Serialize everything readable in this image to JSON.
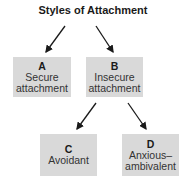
{
  "diagram": {
    "title": "Styles of Attachment",
    "nodes": [
      {
        "letter": "A",
        "line1": "Secure",
        "line2": "attachment"
      },
      {
        "letter": "B",
        "line1": "Insecure",
        "line2": "attachment"
      },
      {
        "letter": "C",
        "line1": "Avoidant",
        "line2": ""
      },
      {
        "letter": "D",
        "line1": "Anxious–",
        "line2": "ambivalent"
      }
    ],
    "edges": [
      {
        "from": "title",
        "to": "A"
      },
      {
        "from": "title",
        "to": "B"
      },
      {
        "from": "B",
        "to": "C"
      },
      {
        "from": "B",
        "to": "D"
      }
    ],
    "box_color": "#d9d9d9"
  }
}
